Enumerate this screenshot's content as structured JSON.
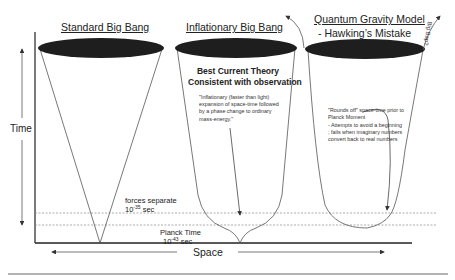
{
  "diagram": {
    "columns": [
      {
        "title": "Standard Big Bang"
      },
      {
        "title": "Inflationary  Big Bang",
        "heading_line1": "Best Current Theory",
        "heading_line2": "Consistent with observation",
        "note": "\"Inflationary (faster than light) expansion of space-time followed by a phase change to ordinary mass-energy.\""
      },
      {
        "title": "Quantum Gravity Model",
        "subtitle": "- Hawking’s Mistake",
        "note_line1": "\"Rounds off\" space-time prior to Planck Moment",
        "note_line2": "- Attempts to avoid a beginning ; fails when imaginary numbers convert back to real numbers",
        "side_label": "Big Bap?"
      }
    ],
    "axes": {
      "y_label": "Time",
      "x_label": "Space"
    },
    "markers": {
      "forces_separate": "forces separate",
      "forces_time_base": "10",
      "forces_time_exp": "-35",
      "forces_unit": "sec",
      "planck_time": "Planck Time",
      "planck_time_base": "10",
      "planck_time_exp": "-43",
      "planck_unit": "sec"
    },
    "colors": {
      "ellipse_fill": "#1e1e1e",
      "line": "#555555",
      "dotted": "#888888",
      "axis": "#222222"
    }
  }
}
